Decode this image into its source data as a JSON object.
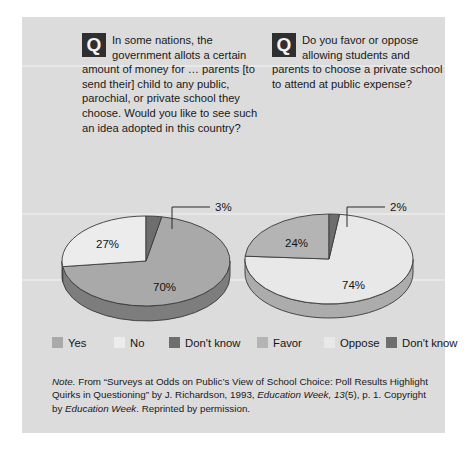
{
  "figure": {
    "background_color": "#dcdcdc",
    "questions": [
      {
        "icon": "question-mark-q-icon",
        "icon_glyph": "Q",
        "text": "In some nations, the government allots a certain amount of money for … parents [to send their] child to any public, parochial, or private school they choose. Would you like to see such an idea adopted in this country?"
      },
      {
        "icon": "question-mark-q-icon",
        "icon_glyph": "Q",
        "text": "Do you favor or oppose allowing students and parents to choose a private school to attend at public expense?"
      }
    ],
    "legend": [
      {
        "label": "Yes",
        "color": "#a9a9a9"
      },
      {
        "label": "No",
        "color": "#ececec"
      },
      {
        "label": "Don't know",
        "color": "#6e6e6e"
      },
      {
        "label": "Favor",
        "color": "#b4b4b4"
      },
      {
        "label": "Oppose",
        "color": "#e8e8e8"
      },
      {
        "label": "Don't know",
        "color": "#6e6e6e"
      }
    ],
    "note": {
      "lead": "Note.",
      "body": " From “Surveys at Odds on Public’s View of School Choice: Poll Results Highlight Quirks in Questioning” by J. Richardson, 1993, ",
      "source_italic_1": "Education Week, 13",
      "mid": "(5), p. 1. Copyright by ",
      "source_italic_2": "Education Week",
      "tail": ". Reprinted by permission."
    }
  },
  "chart_data": [
    {
      "type": "pie",
      "title": "In some nations, the government allots a certain amount of money for … parents [to send their] child to any public, parochial, or private school they choose. Would you like to see such an idea adopted in this country?",
      "categories": [
        "Yes",
        "No",
        "Don't know"
      ],
      "values": [
        70,
        27,
        3
      ],
      "labels": [
        "70%",
        "27%",
        "3%"
      ],
      "colors": [
        "#a9a9a9",
        "#ececec",
        "#6e6e6e"
      ],
      "units": "percent",
      "three_d": true,
      "callout": {
        "category": "Don't know",
        "label": "3%"
      },
      "legend_position": "bottom"
    },
    {
      "type": "pie",
      "title": "Do you favor or oppose allowing students and parents to choose a private school to attend at public expense?",
      "categories": [
        "Favor",
        "Oppose",
        "Don't know"
      ],
      "values": [
        74,
        24,
        2
      ],
      "labels": [
        "74%",
        "24%",
        "2%"
      ],
      "colors": [
        "#e8e8e8",
        "#b4b4b4",
        "#6e6e6e"
      ],
      "units": "percent",
      "three_d": true,
      "callout": {
        "category": "Don't know",
        "label": "2%"
      },
      "legend_position": "bottom"
    }
  ]
}
